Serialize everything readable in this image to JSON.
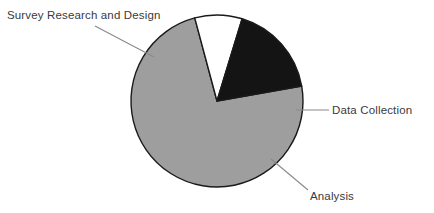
{
  "chart_data": {
    "type": "pie",
    "title": "",
    "subtitle": "",
    "xlabel": "",
    "ylabel": "",
    "grid": false,
    "legend_position": "none",
    "labels_position": "outside-with-leader-lines",
    "background_color": "#ffffff",
    "outline_color": "#1a1a1a",
    "categories": [
      "Survey Research and Design",
      "Data Collection",
      "Analysis"
    ],
    "values": [
      73.5,
      9,
      17.5
    ],
    "units": "percent",
    "slices": [
      {
        "label": "Survey Research and Design",
        "value": 73.5,
        "color": "#9e9e9e",
        "start_angle": 80,
        "end_angle": 345
      },
      {
        "label": "Data Collection",
        "value": 9,
        "color": "#ffffff",
        "start_angle": 345,
        "end_angle": 377
      },
      {
        "label": "Analysis",
        "value": 17.5,
        "color": "#141414",
        "start_angle": 17,
        "end_angle": 80
      }
    ],
    "geometry": {
      "center_x": 217,
      "center_y": 101,
      "radius": 86
    }
  },
  "labels": {
    "survey_research_and_design": "Survey Research and Design",
    "data_collection": "Data Collection",
    "analysis": "Analysis"
  }
}
